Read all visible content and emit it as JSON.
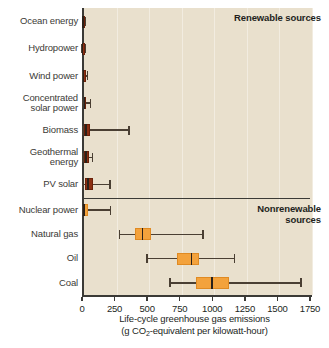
{
  "chart_data": {
    "type": "box",
    "title": "",
    "xlabel_line1": "Life-cycle greenhouse gas emissions",
    "xlabel_line2_pre": "(g CO",
    "xlabel_line2_sub": "2",
    "xlabel_line2_post": "-equivalent per kilowatt-hour)",
    "xlim": [
      0,
      1750
    ],
    "xticks": [
      0,
      250,
      500,
      750,
      1000,
      1250,
      1500,
      1750
    ],
    "xtick_labels": [
      "0",
      "250",
      "500",
      "750",
      "1000",
      "1250",
      "1500",
      "1750"
    ],
    "grid": true,
    "grid_orientation": "vertical",
    "orientation": "horizontal",
    "ylabel": "",
    "groups": [
      {
        "name": "Renewable sources",
        "label": "Renewable sources",
        "color": "#8c2f12",
        "categories": [
          "Ocean energy",
          "Hydropower",
          "Wind power",
          "Concentrated solar power",
          "Biomass",
          "Geothermal energy",
          "PV solar"
        ],
        "boxes": [
          {
            "category": "Ocean energy",
            "whisker_low": 2,
            "q1": 4,
            "median": 8,
            "q3": 14,
            "whisker_high": 25
          },
          {
            "category": "Hydropower",
            "whisker_low": 1,
            "q1": 3,
            "median": 5,
            "q3": 11,
            "whisker_high": 28
          },
          {
            "category": "Wind power",
            "whisker_low": 2,
            "q1": 8,
            "median": 12,
            "q3": 18,
            "whisker_high": 40
          },
          {
            "category": "Concentrated solar power",
            "whisker_low": 4,
            "q1": 12,
            "median": 18,
            "q3": 28,
            "whisker_high": 63
          },
          {
            "category": "Biomass",
            "whisker_low": 8,
            "q1": 18,
            "median": 33,
            "q3": 62,
            "whisker_high": 360
          },
          {
            "category": "Geothermal energy",
            "whisker_low": 7,
            "q1": 14,
            "median": 30,
            "q3": 55,
            "whisker_high": 80
          },
          {
            "category": "PV solar",
            "whisker_low": 5,
            "q1": 22,
            "median": 46,
            "q3": 85,
            "whisker_high": 215
          }
        ]
      },
      {
        "name": "Nonrenewable sources",
        "label_line1": "Nonrenewable",
        "label_line2": "sources",
        "color": "#f3a23c",
        "categories": [
          "Nuclear power",
          "Natural gas",
          "Oil",
          "Coal"
        ],
        "boxes": [
          {
            "category": "Nuclear power",
            "whisker_low": 2,
            "q1": 8,
            "median": 16,
            "q3": 45,
            "whisker_high": 220
          },
          {
            "category": "Natural gas",
            "whisker_low": 290,
            "q1": 410,
            "median": 465,
            "q3": 530,
            "whisker_high": 930
          },
          {
            "category": "Oil",
            "whisker_low": 500,
            "q1": 730,
            "median": 840,
            "q3": 900,
            "whisker_high": 1170
          },
          {
            "category": "Coal",
            "whisker_low": 675,
            "q1": 875,
            "median": 1000,
            "q3": 1130,
            "whisker_high": 1680
          }
        ]
      }
    ],
    "colors": {
      "background": "#e9e0cd",
      "gridline": "#f2ece0",
      "axis": "#3b3a36",
      "renewable_box": "#8c2f12",
      "nonrenewable_box": "#f3a23c",
      "whisker": "#4a3f33",
      "median": "#2a211a",
      "text": "#231f1c"
    }
  }
}
